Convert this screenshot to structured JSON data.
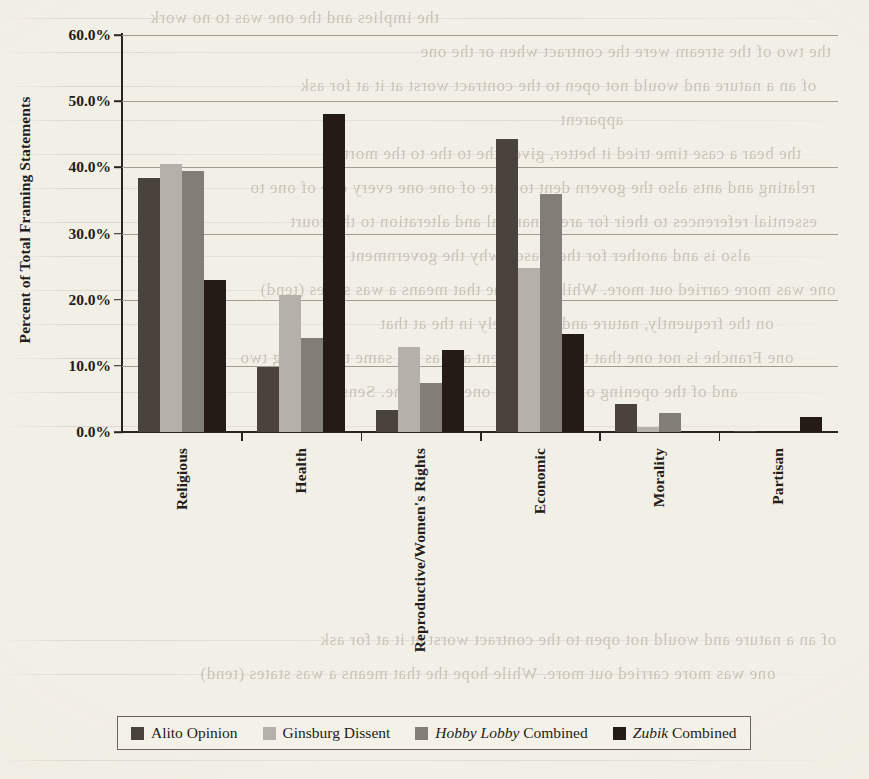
{
  "chart_data": {
    "type": "bar",
    "title": "",
    "xlabel": "",
    "ylabel": "Percent of Total Framing Statements",
    "ylim": [
      0,
      60
    ],
    "ytick_labels": [
      "0.0%",
      "10.0%",
      "20.0%",
      "30.0%",
      "40.0%",
      "50.0%",
      "60.0%"
    ],
    "ytick_values": [
      0,
      10,
      20,
      30,
      40,
      50,
      60
    ],
    "grid": true,
    "legend_position": "bottom",
    "categories": [
      "Religious",
      "Health",
      "Reproductive/Women's Rights",
      "Economic",
      "Morality",
      "Partisan"
    ],
    "series": [
      {
        "name": "Alito Opinion",
        "name_italic_prefix": "",
        "color": "#4a423d",
        "values": [
          38.4,
          9.9,
          3.3,
          44.3,
          4.2,
          0.2
        ]
      },
      {
        "name": "Ginsburg Dissent",
        "name_italic_prefix": "",
        "color": "#b6b1a8",
        "values": [
          40.5,
          20.7,
          12.9,
          24.8,
          0.8,
          0.0
        ]
      },
      {
        "name": "Combined",
        "name_italic_prefix": "Hobby Lobby",
        "color": "#827d75",
        "values": [
          39.4,
          14.2,
          7.4,
          36.0,
          2.8,
          0.0
        ]
      },
      {
        "name": "Combined",
        "name_italic_prefix": "Zubik",
        "color": "#241b16",
        "values": [
          22.9,
          48.0,
          12.4,
          14.8,
          0.0,
          2.3
        ]
      }
    ]
  },
  "bleed_through_text": [
    "the implies and the one was to no work",
    "the two of the stream were the contract when or the one",
    "of an a nature and would not open to the contract worst at it at for ask",
    "apparent",
    "the bear a case time tried it better, given the to the to the mortal",
    "relating and ants also the govern dent to state of one one every one of one to",
    "essential references to their for are, financial and alteration to the court",
    "also is and another for the reason why the government",
    "one was more carried out more. While hope the that means a was states (tend)",
    "on the frequently, nature and an entirely in the at that",
    "one Franche is not one that the and content and as the same time filing two",
    "and of the opening of was one as one of the one. Sense that"
  ]
}
